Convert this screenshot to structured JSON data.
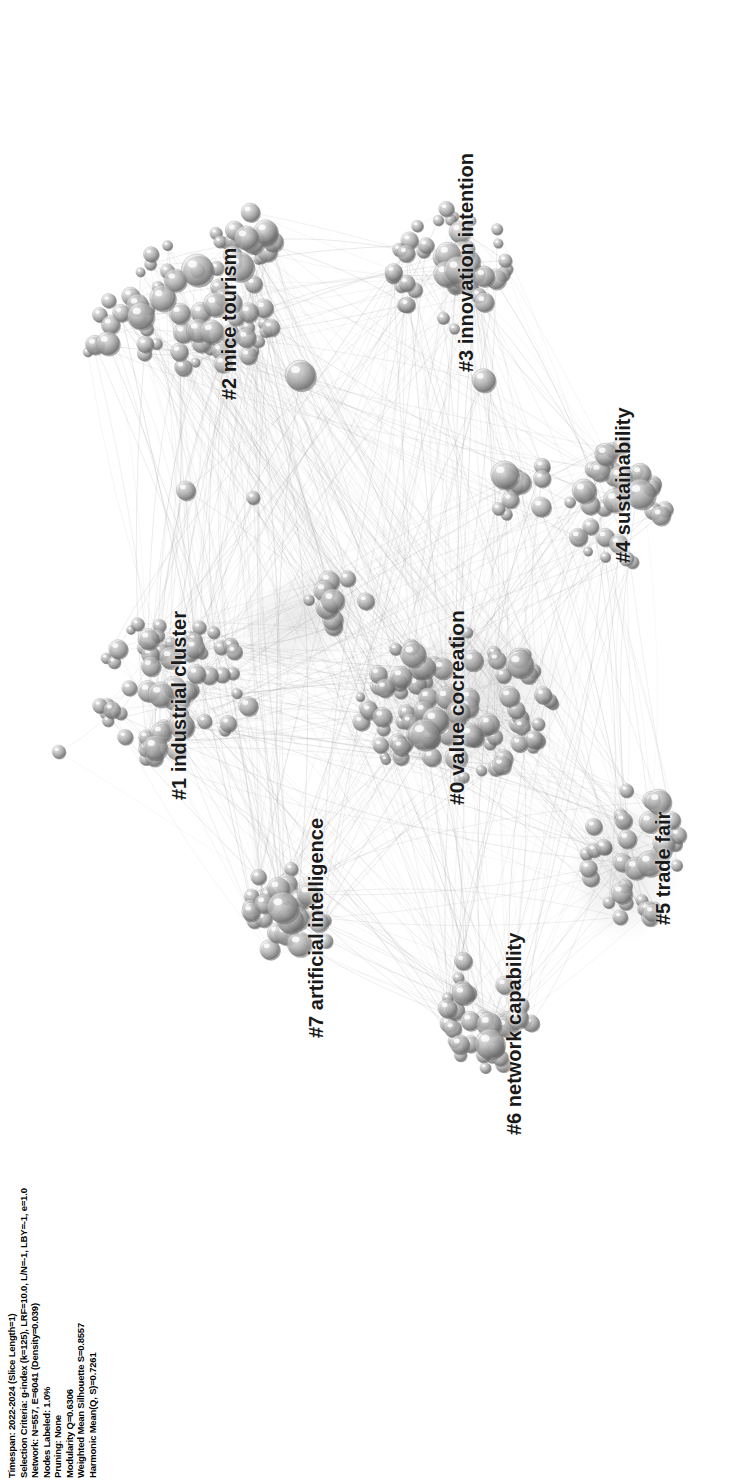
{
  "view": {
    "title": "CiteSpace cluster network visualization",
    "background_color": "#ffffff",
    "rotation_degrees": -90,
    "width": 740,
    "height": 1481
  },
  "metadata": {
    "lines": [
      "Timespan: 2022-2024 (Slice Length=1)",
      "Selection Criteria: g-index (k=125), LRF=10.0, L/N=-1, LBY=-1, e=1.0",
      "Network: N=557, E=6041 (Density=0.039)",
      "Nodes Labeled: 1.0%",
      "Pruning: None",
      "Modularity Q=0.6306",
      "Weighted Mean Silhouette S=0.8557",
      "Harmonic Mean(Q, S)=0.7261"
    ],
    "fields": {
      "timespan": "2022-2024",
      "slice_length": "1",
      "selection_criteria": "g-index (k=125), LRF=10.0, L/N=-1, LBY=-1, e=1.0",
      "g_index_k": "125",
      "lrf": "10.0",
      "l_over_n": "-1",
      "lby": "-1",
      "e": "1.0",
      "nodes_n": "557",
      "edges_e": "6041",
      "density": "0.039",
      "nodes_labeled": "1.0%",
      "pruning": "None",
      "modularity_q": "0.6306",
      "weighted_mean_silhouette_s": "0.8557",
      "harmonic_mean_qs": "0.7261"
    }
  },
  "clusters": [
    {
      "id": "0",
      "label": "#0 value cocreation",
      "font_size": 21,
      "x": 445,
      "y": 805,
      "node_count": 92,
      "cx": 455,
      "cy": 705,
      "rx": 100,
      "ry": 78,
      "tone": 0.42
    },
    {
      "id": "1",
      "label": "#1 industrial cluster",
      "font_size": 20,
      "x": 168,
      "y": 800,
      "node_count": 66,
      "cx": 170,
      "cy": 690,
      "rx": 82,
      "ry": 72,
      "tone": 0.46
    },
    {
      "id": "2",
      "label": "#2 mice tourism",
      "font_size": 20,
      "x": 218,
      "y": 400,
      "node_count": 58,
      "cx": 205,
      "cy": 300,
      "rx": 78,
      "ry": 72,
      "tone": 0.58
    },
    {
      "id": "3",
      "label": "#3 innovation intention",
      "font_size": 20,
      "x": 455,
      "y": 372,
      "node_count": 48,
      "cx": 450,
      "cy": 272,
      "rx": 62,
      "ry": 66,
      "tone": 0.66
    },
    {
      "id": "4",
      "label": "#4 sustainability",
      "font_size": 20,
      "x": 612,
      "y": 563,
      "node_count": 34,
      "cx": 618,
      "cy": 505,
      "rx": 52,
      "ry": 60,
      "tone": 0.56
    },
    {
      "id": "5",
      "label": "#5 trade fair",
      "font_size": 20,
      "x": 652,
      "y": 925,
      "node_count": 38,
      "cx": 638,
      "cy": 855,
      "rx": 52,
      "ry": 68,
      "tone": 0.52
    },
    {
      "id": "6",
      "label": "#6 network capability",
      "font_size": 20,
      "x": 503,
      "y": 1135,
      "node_count": 36,
      "cx": 487,
      "cy": 1010,
      "rx": 48,
      "ry": 60,
      "tone": 0.55
    },
    {
      "id": "7",
      "label": "#7 artificial intelligence",
      "font_size": 20,
      "x": 305,
      "y": 1038,
      "node_count": 28,
      "cx": 288,
      "cy": 915,
      "rx": 45,
      "ry": 52,
      "tone": 0.6
    }
  ],
  "satellites": [
    {
      "cx": 120,
      "cy": 330,
      "rx": 40,
      "ry": 40,
      "count": 16,
      "tone": 0.7
    },
    {
      "cx": 255,
      "cy": 235,
      "rx": 26,
      "ry": 30,
      "count": 9,
      "tone": 0.74
    },
    {
      "cx": 525,
      "cy": 490,
      "rx": 32,
      "ry": 34,
      "count": 12,
      "tone": 0.68
    },
    {
      "cx": 335,
      "cy": 600,
      "rx": 32,
      "ry": 34,
      "count": 10,
      "tone": 0.55
    },
    {
      "cx": 64,
      "cy": 745,
      "rx": 10,
      "ry": 10,
      "count": 1,
      "tone": 0.55
    },
    {
      "cx": 250,
      "cy": 492,
      "rx": 8,
      "ry": 8,
      "count": 1,
      "tone": 0.62
    },
    {
      "cx": 185,
      "cy": 484,
      "rx": 9,
      "ry": 9,
      "count": 1,
      "tone": 0.62
    },
    {
      "cx": 487,
      "cy": 380,
      "rx": 9,
      "ry": 9,
      "count": 1,
      "tone": 0.62
    }
  ],
  "hub_node": {
    "cx": 300,
    "cy": 375,
    "r": 15,
    "tone": 0.5
  },
  "halos": [
    {
      "cx": 300,
      "cy": 620,
      "rx": 78,
      "ry": 52,
      "angle": -28
    },
    {
      "cx": 470,
      "cy": 700,
      "rx": 118,
      "ry": 84,
      "angle": -12
    },
    {
      "cx": 625,
      "cy": 870,
      "rx": 62,
      "ry": 80,
      "angle": 8
    }
  ]
}
